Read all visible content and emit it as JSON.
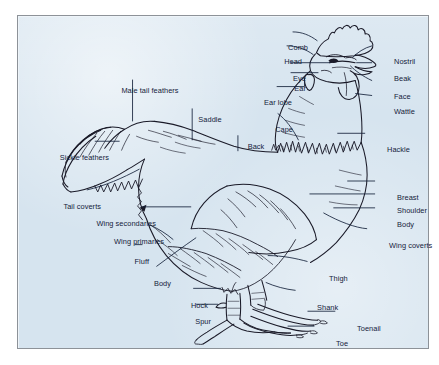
{
  "figure": {
    "kind": "labeled-anatomy-diagram",
    "background_color": "#d6e4ef",
    "frame_color": "#8d9298",
    "ink_color": "#14213a",
    "labels": [
      {
        "id": "comb",
        "text": "Comb",
        "align": "r",
        "x": 290,
        "y": 31
      },
      {
        "id": "head",
        "text": "Head",
        "align": "r",
        "x": 284,
        "y": 45
      },
      {
        "id": "eye",
        "text": "Eye",
        "align": "r",
        "x": 288,
        "y": 62
      },
      {
        "id": "ear",
        "text": "Ear",
        "align": "r",
        "x": 288,
        "y": 72
      },
      {
        "id": "ear-lobe",
        "text": "Ear lobe",
        "align": "r",
        "x": 274,
        "y": 86
      },
      {
        "id": "cape",
        "text": "Cape",
        "align": "r",
        "x": 275,
        "y": 113
      },
      {
        "id": "nostril",
        "text": "Nostril",
        "align": "l",
        "x": 376,
        "y": 45
      },
      {
        "id": "beak",
        "text": "Beak",
        "align": "l",
        "x": 376,
        "y": 62
      },
      {
        "id": "face",
        "text": "Face",
        "align": "l",
        "x": 376,
        "y": 80
      },
      {
        "id": "wattle",
        "text": "Wattle",
        "align": "l",
        "x": 376,
        "y": 95
      },
      {
        "id": "hackle",
        "text": "Hackle",
        "align": "l",
        "x": 369,
        "y": 133
      },
      {
        "id": "breast",
        "text": "Breast",
        "align": "l",
        "x": 379,
        "y": 181
      },
      {
        "id": "shoulder",
        "text": "Shoulder",
        "align": "l",
        "x": 379,
        "y": 194
      },
      {
        "id": "body-right",
        "text": "Body",
        "align": "l",
        "x": 379,
        "y": 208
      },
      {
        "id": "wing-coverts",
        "text": "Wing coverts",
        "align": "l",
        "x": 371,
        "y": 229
      },
      {
        "id": "thigh",
        "text": "Thigh",
        "align": "l",
        "x": 311,
        "y": 262
      },
      {
        "id": "shank",
        "text": "Shank",
        "align": "l",
        "x": 299,
        "y": 291
      },
      {
        "id": "toenail",
        "text": "Toenail",
        "align": "l",
        "x": 339,
        "y": 312
      },
      {
        "id": "toe",
        "text": "Toe",
        "align": "l",
        "x": 318,
        "y": 327
      },
      {
        "id": "male-tail-feathers",
        "text": "Male tail feathers",
        "align": "c",
        "x": 132,
        "y": 74
      },
      {
        "id": "saddle",
        "text": "Saddle",
        "align": "c",
        "x": 192,
        "y": 103
      },
      {
        "id": "back",
        "text": "Back",
        "align": "c",
        "x": 238,
        "y": 130
      },
      {
        "id": "sickle-feathers",
        "text": "Sickle feathers",
        "align": "r",
        "x": 91,
        "y": 141
      },
      {
        "id": "tail-coverts",
        "text": "Tail coverts",
        "align": "r",
        "x": 83,
        "y": 190
      },
      {
        "id": "wing-secondaries",
        "text": "Wing secondaries",
        "align": "r",
        "x": 138,
        "y": 207
      },
      {
        "id": "wing-primaries",
        "text": "Wing primaries",
        "align": "r",
        "x": 146,
        "y": 225
      },
      {
        "id": "fluff",
        "text": "Fluff",
        "align": "r",
        "x": 131,
        "y": 245
      },
      {
        "id": "body-left",
        "text": "Body",
        "align": "r",
        "x": 153,
        "y": 267
      },
      {
        "id": "hock",
        "text": "Hock",
        "align": "r",
        "x": 190,
        "y": 289
      },
      {
        "id": "spur",
        "text": "Spur",
        "align": "r",
        "x": 193,
        "y": 305
      }
    ]
  }
}
